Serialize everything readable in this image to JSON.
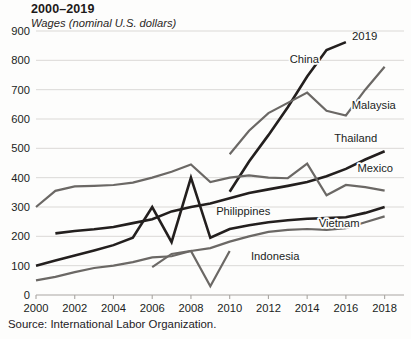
{
  "chart_data": {
    "type": "line",
    "title": "2000–2019",
    "subtitle": "Wages (nominal U.S. dollars)",
    "source": "Source: International Labor Organization.",
    "end_annotation": "2019",
    "xlabel": "",
    "ylabel": "Wages (nominal U.S. dollars)",
    "xlim": [
      2000,
      2019
    ],
    "ylim": [
      0,
      900
    ],
    "ytick_values": [
      0,
      100,
      200,
      300,
      400,
      500,
      600,
      700,
      800,
      900
    ],
    "ytick_labels": [
      "0",
      "100",
      "200",
      "300",
      "400",
      "500",
      "600",
      "700",
      "800",
      "900"
    ],
    "xtick_values": [
      2000,
      2002,
      2004,
      2006,
      2008,
      2010,
      2012,
      2014,
      2016,
      2018
    ],
    "xtick_labels": [
      "2000",
      "2002",
      "2004",
      "2006",
      "2008",
      "2010",
      "2012",
      "2014",
      "2016",
      "2018"
    ],
    "grid": true,
    "legend_position": "inline-right",
    "colors": {
      "dark": "#231f1e",
      "gray": "#6b6865",
      "grid": "#d7d5d2",
      "background": "#fdfdfc"
    },
    "series": [
      {
        "name": "China",
        "label": "China",
        "color": "#231f1e",
        "label_x": 2013.1,
        "label_y": 790,
        "x": [
          2010,
          2011,
          2012,
          2013,
          2014,
          2015,
          2016
        ],
        "values": [
          352,
          455,
          545,
          640,
          745,
          835,
          862
        ]
      },
      {
        "name": "Malaysia",
        "label": "Malaysia",
        "color": "#6b6865",
        "label_x": 2016.3,
        "label_y": 635,
        "x": [
          2010,
          2011,
          2012,
          2013,
          2014,
          2015,
          2016,
          2017,
          2018
        ],
        "values": [
          480,
          560,
          620,
          655,
          690,
          628,
          612,
          700,
          778
        ]
      },
      {
        "name": "Thailand",
        "label": "Thailand",
        "color": "#231f1e",
        "label_x": 2015.4,
        "label_y": 520,
        "x": [
          2001,
          2002,
          2003,
          2004,
          2005,
          2006,
          2007,
          2008,
          2009,
          2010,
          2011,
          2012,
          2013,
          2014,
          2015,
          2016,
          2017,
          2018
        ],
        "values": [
          210,
          218,
          224,
          232,
          245,
          258,
          285,
          300,
          312,
          330,
          348,
          360,
          372,
          385,
          405,
          430,
          462,
          490
        ]
      },
      {
        "name": "Mexico",
        "label": "Mexico",
        "color": "#6b6865",
        "label_x": 2016.6,
        "label_y": 420,
        "x": [
          2000,
          2001,
          2002,
          2003,
          2004,
          2005,
          2006,
          2007,
          2008,
          2009,
          2010,
          2011,
          2012,
          2013,
          2014,
          2015,
          2016,
          2017,
          2018
        ],
        "values": [
          300,
          355,
          370,
          372,
          375,
          383,
          400,
          420,
          445,
          385,
          400,
          408,
          400,
          398,
          448,
          340,
          375,
          368,
          356
        ]
      },
      {
        "name": "Philippines",
        "label": "Philippines",
        "color": "#231f1e",
        "label_x": 2009.3,
        "label_y": 272,
        "x": [
          2000,
          2001,
          2002,
          2003,
          2004,
          2005,
          2006,
          2007,
          2008,
          2009,
          2010,
          2011,
          2012,
          2013,
          2014,
          2015,
          2016,
          2017,
          2018
        ],
        "values": [
          100,
          118,
          135,
          152,
          170,
          195,
          300,
          180,
          400,
          195,
          225,
          238,
          248,
          255,
          260,
          262,
          265,
          280,
          300
        ]
      },
      {
        "name": "Vietnam",
        "label": "Vietnam",
        "color": "#6b6865",
        "label_x": 2014.6,
        "label_y": 232,
        "x": [
          2000,
          2001,
          2002,
          2003,
          2004,
          2005,
          2006,
          2007,
          2008,
          2009,
          2010,
          2011,
          2012,
          2013,
          2014,
          2015,
          2016,
          2017,
          2018
        ],
        "values": [
          50,
          62,
          78,
          92,
          100,
          112,
          128,
          132,
          150,
          160,
          182,
          200,
          215,
          222,
          225,
          222,
          228,
          248,
          268
        ]
      },
      {
        "name": "Indonesia",
        "label": "Indonesia",
        "color": "#6b6865",
        "label_x": 2011.1,
        "label_y": 118,
        "x": [
          2006,
          2007,
          2008,
          2009,
          2010
        ],
        "values": [
          95,
          140,
          150,
          30,
          150
        ]
      }
    ]
  }
}
